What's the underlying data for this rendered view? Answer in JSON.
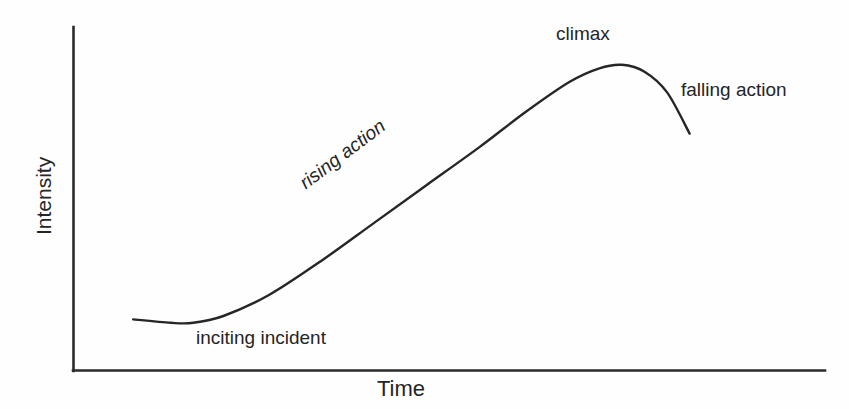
{
  "figure": {
    "background_color": "#fefefe",
    "ink_color": "#252525"
  },
  "axes": {
    "y_label": "Intensity",
    "x_label": "Time"
  },
  "annotations": {
    "inciting_incident": "inciting incident",
    "rising_action": "rising action",
    "climax": "climax",
    "falling_action": "falling action"
  },
  "chart_data": {
    "type": "line",
    "title": "",
    "xlabel": "Time",
    "ylabel": "Intensity",
    "grid": false,
    "legend": "none",
    "axis_style": "open-left-bottom",
    "tick_labels": {
      "x": [],
      "y": []
    },
    "xlim": [
      0,
      100
    ],
    "ylim": [
      0,
      100
    ],
    "series": [
      {
        "name": "narrative intensity",
        "description": "Freytag plot arc: flat exposition, slight dip at inciting incident, long steady rise, rounded peak at climax, then a steep falling action.",
        "x": [
          8,
          13,
          16,
          20,
          26,
          33,
          40,
          47,
          54,
          60,
          66,
          70,
          73,
          76,
          79,
          82
        ],
        "y": [
          15,
          14,
          14,
          16,
          22,
          32,
          43,
          54,
          65,
          75,
          84,
          88,
          89,
          87,
          81,
          69
        ]
      }
    ],
    "annotations": [
      {
        "text": "inciting incident",
        "x": 18,
        "y": 8,
        "rotation": 0,
        "style": "normal"
      },
      {
        "text": "rising action",
        "x": 40,
        "y": 52,
        "rotation": -37,
        "style": "italic"
      },
      {
        "text": "climax",
        "x": 72,
        "y": 95,
        "rotation": 0,
        "style": "normal"
      },
      {
        "text": "falling action",
        "x": 86,
        "y": 80,
        "rotation": 0,
        "style": "normal"
      }
    ]
  }
}
